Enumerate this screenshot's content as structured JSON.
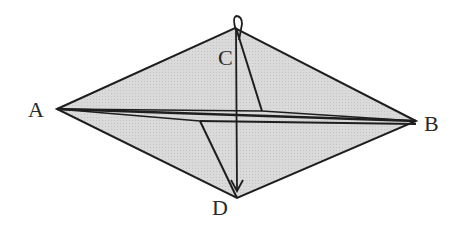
{
  "diagram": {
    "type": "folded-paper-geometry",
    "fill_color": "#d9d9d9",
    "stroke_color": "#1e1e1e",
    "points": {
      "A": {
        "label": "A",
        "x": 57,
        "y": 109
      },
      "B": {
        "label": "B",
        "x": 416,
        "y": 121
      },
      "C": {
        "label": "C",
        "x": 235,
        "y": 28
      },
      "D": {
        "label": "D",
        "x": 237,
        "y": 198
      }
    },
    "labels": [
      {
        "id": "A",
        "text": "A",
        "x": 28,
        "y": 117
      },
      {
        "id": "B",
        "text": "B",
        "x": 424,
        "y": 131
      },
      {
        "id": "C",
        "text": "C",
        "x": 218,
        "y": 65
      },
      {
        "id": "D",
        "text": "D",
        "x": 212,
        "y": 215
      }
    ],
    "arrow": {
      "description": "fold arrow from C down to D",
      "from": "C",
      "to": "D"
    }
  }
}
